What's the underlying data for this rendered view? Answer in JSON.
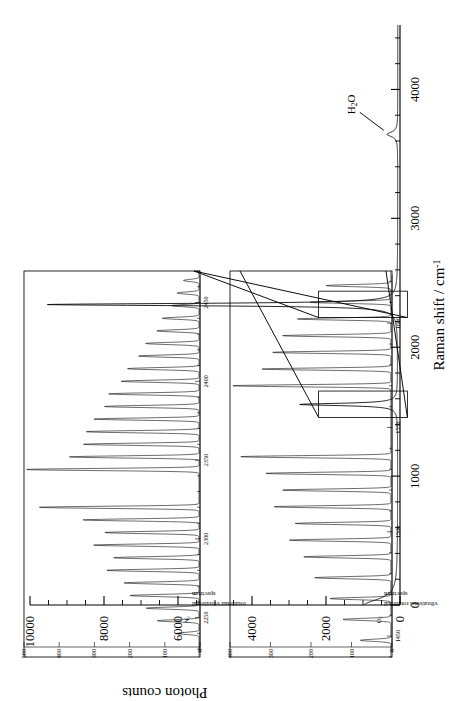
{
  "chart_data": {
    "type": "line",
    "title": "",
    "xlabel": "Raman shift / cm",
    "xlabel_sup": "-1",
    "ylabel": "Photon counts",
    "xlim": [
      0,
      4500
    ],
    "ylim": [
      0,
      10000
    ],
    "xticks": [
      0,
      1000,
      2000,
      3000,
      4000
    ],
    "xticklabels": [
      "0",
      "1000",
      "2000",
      "3000",
      "4000"
    ],
    "yticks": [
      0,
      2000,
      4000,
      6000,
      8000,
      10000
    ],
    "yticklabels": [
      "0",
      "2000",
      "4000",
      "6000",
      "8000",
      "10000"
    ],
    "x_minor_step": 200,
    "y_minor_step": 500,
    "grid": false,
    "legend": null,
    "annotations": [
      {
        "text": "H",
        "sub": "2",
        "text2": "O",
        "x": 3652,
        "y": 330,
        "label": "water-peak"
      }
    ],
    "series": [
      {
        "name": "Raman spectrum of air",
        "baseline": 60,
        "peaks": [
          {
            "name": "Rayleigh wing",
            "center": 0,
            "height": 900,
            "width": 55
          },
          {
            "name": "O2 stretch",
            "center": 1556,
            "height": 2650,
            "width": 11
          },
          {
            "name": "N2 stretch",
            "center": 2331,
            "height": 9480,
            "width": 11
          },
          {
            "name": "H2O stretch",
            "center": 3652,
            "height": 290,
            "width": 22
          }
        ]
      }
    ]
  },
  "insets": [
    {
      "id": "n2-inset",
      "caption_species": "N",
      "caption_sub": "2",
      "caption_line1": "rotational vibrational",
      "caption_line2": "spectrum",
      "type": "line",
      "xlim": [
        2225,
        2470
      ],
      "ylim": [
        0,
        500
      ],
      "xticks": [
        2250,
        2300,
        2350,
        2400,
        2450
      ],
      "xticklabels": [
        "2250",
        "2300",
        "2350",
        "2400",
        "2450"
      ],
      "yticks": [
        0,
        100,
        200,
        300,
        400,
        500
      ],
      "yticklabels": [
        "0",
        "100",
        "200",
        "300",
        "400",
        "500"
      ],
      "branch_gap_center": 2331,
      "lines": [
        {
          "x": 2240,
          "y": 62
        },
        {
          "x": 2248,
          "y": 118
        },
        {
          "x": 2256,
          "y": 150
        },
        {
          "x": 2264,
          "y": 196
        },
        {
          "x": 2272,
          "y": 213
        },
        {
          "x": 2280,
          "y": 262
        },
        {
          "x": 2288,
          "y": 243
        },
        {
          "x": 2296,
          "y": 300
        },
        {
          "x": 2304,
          "y": 268
        },
        {
          "x": 2312,
          "y": 330
        },
        {
          "x": 2320,
          "y": 455
        },
        {
          "x": 2344,
          "y": 492
        },
        {
          "x": 2352,
          "y": 370
        },
        {
          "x": 2360,
          "y": 330
        },
        {
          "x": 2368,
          "y": 322
        },
        {
          "x": 2376,
          "y": 300
        },
        {
          "x": 2384,
          "y": 270
        },
        {
          "x": 2392,
          "y": 258
        },
        {
          "x": 2400,
          "y": 222
        },
        {
          "x": 2408,
          "y": 204
        },
        {
          "x": 2416,
          "y": 172
        },
        {
          "x": 2424,
          "y": 152
        },
        {
          "x": 2432,
          "y": 120
        },
        {
          "x": 2440,
          "y": 104
        },
        {
          "x": 2448,
          "y": 78
        },
        {
          "x": 2456,
          "y": 62
        },
        {
          "x": 2464,
          "y": 44
        }
      ]
    },
    {
      "id": "o2-inset",
      "caption_species": "O",
      "caption_sub": "2",
      "caption_line1": "vibrational rotational",
      "caption_line2": "spectrum",
      "type": "line",
      "xlim": [
        1440,
        1625
      ],
      "ylim": [
        0,
        400
      ],
      "xticks": [
        1450,
        1500,
        1550,
        1600
      ],
      "xticklabels": [
        "1450",
        "1500",
        "1550",
        "1600"
      ],
      "yticks": [
        0,
        100,
        200,
        300,
        400
      ],
      "yticklabels": [
        "0",
        "100",
        "200",
        "300",
        "400"
      ],
      "branch_gap_center": 1556,
      "lines": [
        {
          "x": 1448,
          "y": 75
        },
        {
          "x": 1458,
          "y": 118
        },
        {
          "x": 1468,
          "y": 150
        },
        {
          "x": 1478,
          "y": 188
        },
        {
          "x": 1488,
          "y": 215
        },
        {
          "x": 1496,
          "y": 250
        },
        {
          "x": 1504,
          "y": 236
        },
        {
          "x": 1512,
          "y": 288
        },
        {
          "x": 1520,
          "y": 268
        },
        {
          "x": 1528,
          "y": 310
        },
        {
          "x": 1536,
          "y": 372
        },
        {
          "x": 1570,
          "y": 390
        },
        {
          "x": 1578,
          "y": 318
        },
        {
          "x": 1586,
          "y": 292
        },
        {
          "x": 1594,
          "y": 268
        },
        {
          "x": 1602,
          "y": 232
        },
        {
          "x": 1610,
          "y": 200
        },
        {
          "x": 1618,
          "y": 160
        }
      ]
    }
  ]
}
